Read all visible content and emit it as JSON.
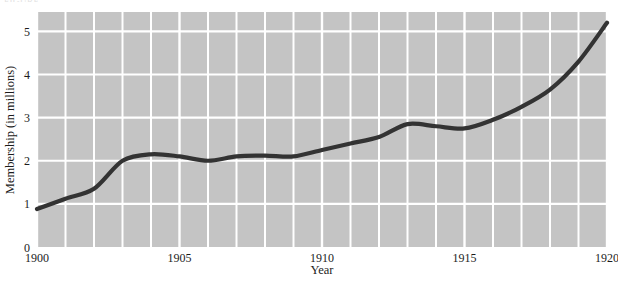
{
  "figure": {
    "cropped_caption_fragment": "FIGURE",
    "background_color": "#ffffff",
    "plot_background_color": "#c4c4c4",
    "gridline_color": "#ffffff",
    "line_color": "#333333"
  },
  "chart_data": {
    "type": "line",
    "title": "",
    "xlabel": "Year",
    "ylabel": "Membership (in millions)",
    "xlim": [
      1900,
      1920
    ],
    "ylim": [
      0,
      5.45
    ],
    "xticks": [
      1900,
      1905,
      1910,
      1915,
      1920
    ],
    "xtick_labels": [
      "1900",
      "1905",
      "1910",
      "1915",
      "1920"
    ],
    "yticks": [
      0,
      1,
      2,
      3,
      4,
      5
    ],
    "ytick_labels": [
      "0",
      "1",
      "2",
      "3",
      "4",
      "5"
    ],
    "grid": true,
    "grid_minor_x_every": 1,
    "legend": null,
    "series": [
      {
        "name": "Membership",
        "x": [
          1900,
          1901,
          1902,
          1903,
          1904,
          1905,
          1906,
          1907,
          1908,
          1909,
          1910,
          1911,
          1912,
          1913,
          1914,
          1915,
          1916,
          1917,
          1918,
          1919,
          1920
        ],
        "values": [
          0.88,
          1.12,
          1.35,
          2.0,
          2.15,
          2.1,
          2.0,
          2.1,
          2.12,
          2.1,
          2.25,
          2.4,
          2.55,
          2.85,
          2.8,
          2.75,
          2.95,
          3.25,
          3.65,
          4.3,
          5.2
        ]
      }
    ]
  }
}
